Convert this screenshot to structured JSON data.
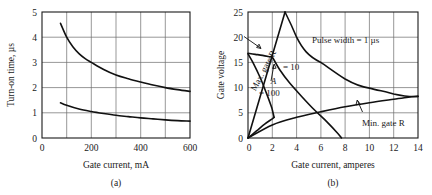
{
  "figure": {
    "panels": [
      {
        "id": "a",
        "caption": "(a)",
        "xlabel": "Gate current, mA",
        "ylabel": "Turn-on time, µs"
      },
      {
        "id": "b",
        "caption": "(b)",
        "xlabel": "Gate current, amperes",
        "ylabel": "Gate voltage"
      }
    ]
  },
  "chart_data": [
    {
      "type": "line",
      "panel": "a",
      "title": "",
      "xlabel": "Gate current, mA",
      "ylabel": "Turn-on time, µs",
      "xlim": [
        0,
        600
      ],
      "ylim": [
        0,
        5
      ],
      "xticks": [
        0,
        100,
        200,
        300,
        400,
        500,
        600
      ],
      "xtick_labels": [
        "0",
        "",
        "200",
        "",
        "400",
        "",
        "600"
      ],
      "yticks": [
        0,
        1,
        2,
        3,
        4,
        5
      ],
      "ytick_labels": [
        "0",
        "1",
        "2",
        "3",
        "4",
        "5"
      ],
      "grid": true,
      "legend": "none",
      "series": [
        {
          "name": "upper-turn-on-time",
          "x": [
            75,
            100,
            125,
            150,
            175,
            200,
            250,
            300,
            350,
            400,
            450,
            500,
            550,
            600
          ],
          "y": [
            4.55,
            4.0,
            3.62,
            3.35,
            3.15,
            3.0,
            2.72,
            2.5,
            2.35,
            2.22,
            2.1,
            2.0,
            1.92,
            1.85
          ]
        },
        {
          "name": "lower-turn-on-time",
          "x": [
            75,
            100,
            150,
            200,
            250,
            300,
            350,
            400,
            450,
            500,
            550,
            600
          ],
          "y": [
            1.4,
            1.3,
            1.15,
            1.05,
            0.97,
            0.9,
            0.85,
            0.8,
            0.76,
            0.72,
            0.69,
            0.67
          ]
        }
      ]
    },
    {
      "type": "line",
      "panel": "b",
      "title": "",
      "xlabel": "Gate current, amperes",
      "ylabel": "Gate voltage",
      "xlim": [
        0,
        14
      ],
      "ylim": [
        0,
        25
      ],
      "xticks": [
        0,
        2,
        4,
        6,
        8,
        10,
        12,
        14
      ],
      "xtick_labels": [
        "0",
        "2",
        "4",
        "6",
        "8",
        "10",
        "12",
        "14"
      ],
      "yticks": [
        0,
        5,
        10,
        15,
        20,
        25
      ],
      "ytick_labels": [
        "0",
        "5",
        "10",
        "15",
        "20",
        "25"
      ],
      "grid": true,
      "legend": "none",
      "annotations": [
        {
          "id": "max-gate-r",
          "text": "Max. gate R",
          "rotated": true
        },
        {
          "id": "pulse-width",
          "text": "Pulse width = 1 µs"
        },
        {
          "id": "min-gate-r",
          "text": "Min. gate R"
        },
        {
          "id": "ohm-10",
          "text": "= 10"
        },
        {
          "id": "ohm-100",
          "text": "= 100"
        },
        {
          "id": "point-a",
          "text": "A"
        }
      ],
      "series": [
        {
          "name": "max-gate-r-line",
          "x": [
            0,
            3.05
          ],
          "y": [
            0,
            25.0
          ]
        },
        {
          "name": "pulse-width-1us-boundary",
          "x": [
            3.05,
            3.6,
            4.2,
            5.0,
            6.0,
            7.0,
            8.0,
            9.0,
            10.0,
            11.0,
            12.0,
            13.0,
            14.0
          ],
          "y": [
            25.0,
            22.3,
            19.8,
            17.2,
            14.8,
            13.0,
            11.7,
            10.7,
            9.9,
            9.3,
            8.8,
            8.45,
            8.25
          ]
        },
        {
          "name": "min-gate-r-line",
          "x": [
            0,
            2.0,
            4.0,
            6.0,
            8.0,
            10.0,
            12.0,
            13.2,
            14.0
          ],
          "y": [
            0,
            2.6,
            4.1,
            5.2,
            6.2,
            7.0,
            7.7,
            8.1,
            8.25
          ]
        },
        {
          "name": "ohm-10-curve",
          "x": [
            0,
            0.6,
            1.2,
            1.8,
            2.0,
            2.6,
            3.4,
            4.4,
            5.5,
            6.5,
            7.4,
            7.7
          ],
          "y": [
            16.8,
            16.6,
            16.4,
            16.1,
            16.0,
            13.6,
            11.0,
            8.3,
            5.5,
            3.2,
            0.9,
            0.0
          ]
        },
        {
          "name": "ohm-100-curve",
          "x": [
            0,
            0.4,
            1.0,
            1.5,
            1.9,
            2.0,
            2.15
          ],
          "y": [
            16.7,
            15.0,
            12.0,
            9.0,
            6.4,
            5.6,
            4.1
          ]
        },
        {
          "name": "lower-left-boundary",
          "x": [
            0,
            0.7,
            1.4,
            2.0,
            2.15
          ],
          "y": [
            0,
            1.4,
            2.8,
            3.8,
            4.1
          ]
        }
      ]
    }
  ]
}
